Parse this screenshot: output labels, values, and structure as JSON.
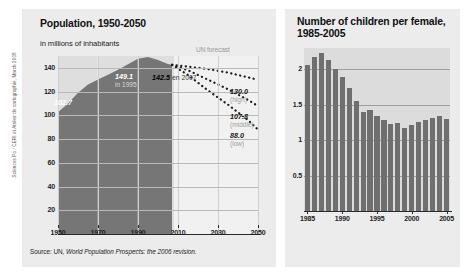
{
  "credit": "Sciences Po / CERI et Atelier de cartographie, March 2008",
  "left": {
    "title": "Population, 1950-2050",
    "subtitle": "in millions of inhabitants",
    "forecast_label": "UN forecast",
    "source_prefix": "Source: UN, ",
    "source_italic": "World Population Prospects: the 2006 revision.",
    "annotations": {
      "start": "102.7",
      "peak_value": "149.1",
      "peak_note": "in 1995",
      "y2007_value": "142.5",
      "y2007_note": "en 2007",
      "high_value": "130.0",
      "high_note": "(high)",
      "middle_value": "107.8",
      "middle_note": "(middle)",
      "low_value": "88.0",
      "low_note": "(low)"
    }
  },
  "right": {
    "title": "Number of children per female, 1985-2005"
  },
  "colors": {
    "panel_bg": "#ececed",
    "hist_plot_bg": "#dedede",
    "forecast_plot_bg": "#f1f1f1",
    "area_fill": "#767676",
    "bar_fill": "#6f6f6f",
    "bars_plot_bg": "#dcdcdc",
    "gridline": "#b9b9b9",
    "axis": "#2a2a2a",
    "muted_text": "#9d9d9d"
  },
  "chart_data": [
    {
      "type": "area",
      "title": "Population, 1950-2050",
      "xlabel": "",
      "ylabel": "in millions of inhabitants",
      "xlim": [
        1950,
        2050
      ],
      "ylim": [
        0,
        150
      ],
      "yticks": [
        20,
        40,
        60,
        80,
        100,
        120,
        140
      ],
      "xticks": [
        1950,
        1970,
        1990,
        2010,
        2030,
        2050
      ],
      "grid": true,
      "legend": "none",
      "series": [
        {
          "name": "Population (historical)",
          "style": "area",
          "x": [
            1950,
            1955,
            1960,
            1965,
            1970,
            1975,
            1980,
            1985,
            1990,
            1995,
            2000,
            2005,
            2007
          ],
          "values": [
            102.7,
            110.0,
            119.0,
            126.0,
            130.2,
            134.2,
            138.5,
            143.0,
            147.7,
            149.1,
            146.6,
            143.2,
            142.5
          ]
        },
        {
          "name": "high",
          "style": "dotted",
          "x": [
            2007,
            2015,
            2025,
            2035,
            2045,
            2050
          ],
          "values": [
            142.5,
            141.0,
            139.0,
            136.0,
            132.0,
            130.0
          ]
        },
        {
          "name": "middle",
          "style": "dotted",
          "x": [
            2007,
            2015,
            2025,
            2035,
            2045,
            2050
          ],
          "values": [
            142.5,
            138.0,
            130.0,
            122.0,
            113.0,
            107.8
          ]
        },
        {
          "name": "low",
          "style": "dotted",
          "x": [
            2007,
            2015,
            2025,
            2035,
            2045,
            2050
          ],
          "values": [
            142.5,
            134.0,
            121.0,
            109.0,
            96.0,
            88.0
          ]
        }
      ],
      "annotations": [
        {
          "text": "102.7",
          "x": 1952,
          "y": 102.7
        },
        {
          "text": "149.1 in 1995",
          "x": 1995,
          "y": 149.1
        },
        {
          "text": "142.5 en 2007",
          "x": 2007,
          "y": 142.5
        },
        {
          "text": "130.0 (high)",
          "x": 2050,
          "y": 130.0
        },
        {
          "text": "107.8 (middle)",
          "x": 2050,
          "y": 107.8
        },
        {
          "text": "88.0 (low)",
          "x": 2050,
          "y": 88.0
        },
        {
          "text": "UN forecast",
          "x": 2012,
          "y": 150
        }
      ]
    },
    {
      "type": "bar",
      "title": "Number of children per female, 1985-2005",
      "xlabel": "",
      "ylabel": "",
      "ylim": [
        0,
        2.3
      ],
      "yticks": [
        0.5,
        1,
        1.5,
        2
      ],
      "xticks": [
        1985,
        1990,
        1995,
        2000,
        2005
      ],
      "grid": true,
      "categories": [
        1985,
        1986,
        1987,
        1988,
        1989,
        1990,
        1991,
        1992,
        1993,
        1994,
        1995,
        1996,
        1997,
        1998,
        1999,
        2000,
        2001,
        2002,
        2003,
        2004,
        2005
      ],
      "values": [
        2.06,
        2.18,
        2.23,
        2.13,
        2.0,
        1.89,
        1.73,
        1.55,
        1.4,
        1.42,
        1.34,
        1.28,
        1.23,
        1.24,
        1.17,
        1.21,
        1.25,
        1.29,
        1.31,
        1.34,
        1.3
      ]
    }
  ]
}
